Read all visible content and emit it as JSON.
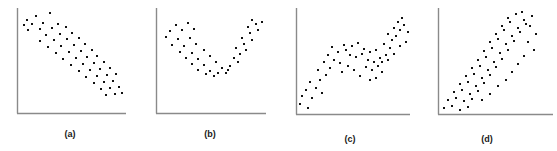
{
  "figure": {
    "width": 557,
    "height": 151,
    "background": "#ffffff",
    "axis_color": "#8a8a8a",
    "dot_color": "#111111",
    "label_color": "#1a1a1a"
  },
  "panels": [
    {
      "id": "panel-a",
      "label": "(a)",
      "left": 0,
      "label_left": 0,
      "label_top": 129,
      "label_width": 140,
      "axis": {
        "x": 17,
        "y_top": 8,
        "y_bottom": 113,
        "x_right": 126
      },
      "pattern": "negative linear association"
    },
    {
      "id": "panel-b",
      "label": "(b)",
      "left": 0,
      "label_left": 140,
      "label_top": 129,
      "label_width": 140,
      "axis": {
        "x": 156,
        "y_top": 8,
        "y_bottom": 113,
        "x_right": 266
      },
      "pattern": "curved U-shaped (quadratic) association"
    },
    {
      "id": "panel-c",
      "label": "(c)",
      "left": 0,
      "label_left": 280,
      "label_top": 134,
      "label_width": 140,
      "axis": {
        "x": 296,
        "y_top": 8,
        "y_bottom": 114,
        "x_right": 410
      },
      "pattern": "increasing with a flat plateau in the middle"
    },
    {
      "id": "panel-d",
      "label": "(d)",
      "left": 0,
      "label_left": 417,
      "label_top": 134,
      "label_width": 140,
      "axis": {
        "x": 438,
        "y_top": 8,
        "y_bottom": 114,
        "x_right": 553
      },
      "pattern": "positive increasing curved association"
    }
  ],
  "chart_data": {
    "type": "scatter",
    "title": "",
    "xlabel": "",
    "ylabel": "",
    "grid": false,
    "legend": "none",
    "axes_shown": [
      "x",
      "y"
    ],
    "tick_labels": [],
    "panels": [
      {
        "name": "(a)",
        "pattern": "negative linear",
        "xlim": [
          17,
          126
        ],
        "ylim": [
          8,
          113
        ],
        "points": [
          [
            27,
            20
          ],
          [
            36,
            16
          ],
          [
            50,
            13
          ],
          [
            24,
            25
          ],
          [
            32,
            24
          ],
          [
            43,
            23
          ],
          [
            58,
            24
          ],
          [
            28,
            30
          ],
          [
            40,
            29
          ],
          [
            52,
            28
          ],
          [
            66,
            27
          ],
          [
            46,
            35
          ],
          [
            60,
            34
          ],
          [
            72,
            33
          ],
          [
            40,
            41
          ],
          [
            54,
            40
          ],
          [
            67,
            39
          ],
          [
            79,
            38
          ],
          [
            48,
            47
          ],
          [
            61,
            46
          ],
          [
            74,
            45
          ],
          [
            85,
            44
          ],
          [
            56,
            53
          ],
          [
            69,
            52
          ],
          [
            81,
            51
          ],
          [
            92,
            50
          ],
          [
            63,
            59
          ],
          [
            76,
            58
          ],
          [
            87,
            57
          ],
          [
            97,
            56
          ],
          [
            71,
            65
          ],
          [
            83,
            64
          ],
          [
            94,
            63
          ],
          [
            104,
            62
          ],
          [
            79,
            71
          ],
          [
            90,
            70
          ],
          [
            100,
            69
          ],
          [
            110,
            68
          ],
          [
            86,
            77
          ],
          [
            97,
            76
          ],
          [
            107,
            75
          ],
          [
            116,
            74
          ],
          [
            94,
            83
          ],
          [
            104,
            82
          ],
          [
            113,
            81
          ],
          [
            101,
            89
          ],
          [
            110,
            88
          ],
          [
            119,
            87
          ],
          [
            106,
            95
          ],
          [
            115,
            94
          ],
          [
            122,
            93
          ]
        ]
      },
      {
        "name": "(b)",
        "pattern": "U-shaped curve",
        "xlim": [
          156,
          266
        ],
        "ylim": [
          8,
          113
        ],
        "points": [
          [
            176,
            25
          ],
          [
            188,
            23
          ],
          [
            170,
            31
          ],
          [
            182,
            30
          ],
          [
            194,
            29
          ],
          [
            166,
            37
          ],
          [
            178,
            39
          ],
          [
            190,
            38
          ],
          [
            172,
            45
          ],
          [
            184,
            46
          ],
          [
            196,
            44
          ],
          [
            180,
            52
          ],
          [
            192,
            53
          ],
          [
            204,
            50
          ],
          [
            186,
            58
          ],
          [
            198,
            59
          ],
          [
            210,
            56
          ],
          [
            192,
            64
          ],
          [
            204,
            65
          ],
          [
            216,
            62
          ],
          [
            198,
            70
          ],
          [
            210,
            71
          ],
          [
            222,
            68
          ],
          [
            206,
            74
          ],
          [
            218,
            73
          ],
          [
            228,
            70
          ],
          [
            214,
            76
          ],
          [
            226,
            73
          ],
          [
            230,
            66
          ],
          [
            238,
            62
          ],
          [
            234,
            58
          ],
          [
            240,
            54
          ],
          [
            246,
            50
          ],
          [
            236,
            48
          ],
          [
            244,
            44
          ],
          [
            252,
            40
          ],
          [
            242,
            38
          ],
          [
            250,
            33
          ],
          [
            258,
            30
          ],
          [
            248,
            27
          ],
          [
            256,
            24
          ],
          [
            262,
            22
          ],
          [
            252,
            20
          ]
        ]
      },
      {
        "name": "(c)",
        "pattern": "rising then plateau then rising",
        "xlim": [
          296,
          410
        ],
        "ylim": [
          8,
          114
        ],
        "points": [
          [
            300,
            104
          ],
          [
            308,
            108
          ],
          [
            302,
            96
          ],
          [
            312,
            98
          ],
          [
            306,
            90
          ],
          [
            316,
            88
          ],
          [
            322,
            93
          ],
          [
            310,
            82
          ],
          [
            320,
            80
          ],
          [
            326,
            75
          ],
          [
            318,
            70
          ],
          [
            330,
            68
          ],
          [
            324,
            62
          ],
          [
            334,
            60
          ],
          [
            340,
            63
          ],
          [
            328,
            55
          ],
          [
            338,
            52
          ],
          [
            346,
            50
          ],
          [
            332,
            47
          ],
          [
            344,
            45
          ],
          [
            352,
            46
          ],
          [
            358,
            43
          ],
          [
            350,
            55
          ],
          [
            356,
            57
          ],
          [
            362,
            54
          ],
          [
            364,
            49
          ],
          [
            370,
            52
          ],
          [
            376,
            50
          ],
          [
            368,
            60
          ],
          [
            374,
            62
          ],
          [
            380,
            58
          ],
          [
            366,
            67
          ],
          [
            372,
            70
          ],
          [
            378,
            66
          ],
          [
            382,
            62
          ],
          [
            386,
            55
          ],
          [
            390,
            48
          ],
          [
            384,
            44
          ],
          [
            392,
            40
          ],
          [
            388,
            34
          ],
          [
            396,
            36
          ],
          [
            394,
            28
          ],
          [
            400,
            30
          ],
          [
            398,
            22
          ],
          [
            404,
            25
          ],
          [
            402,
            18
          ],
          [
            408,
            32
          ],
          [
            406,
            42
          ],
          [
            400,
            46
          ],
          [
            394,
            54
          ],
          [
            388,
            60
          ],
          [
            382,
            72
          ],
          [
            376,
            78
          ],
          [
            370,
            80
          ],
          [
            360,
            76
          ],
          [
            354,
            70
          ],
          [
            348,
            66
          ],
          [
            342,
            72
          ]
        ]
      },
      {
        "name": "(d)",
        "pattern": "increasing curved",
        "xlim": [
          438,
          553
        ],
        "ylim": [
          8,
          114
        ],
        "points": [
          [
            444,
            108
          ],
          [
            452,
            106
          ],
          [
            460,
            110
          ],
          [
            468,
            107
          ],
          [
            448,
            100
          ],
          [
            456,
            98
          ],
          [
            464,
            101
          ],
          [
            472,
            99
          ],
          [
            454,
            92
          ],
          [
            462,
            90
          ],
          [
            470,
            94
          ],
          [
            478,
            91
          ],
          [
            460,
            84
          ],
          [
            468,
            82
          ],
          [
            476,
            86
          ],
          [
            484,
            83
          ],
          [
            466,
            76
          ],
          [
            474,
            74
          ],
          [
            482,
            78
          ],
          [
            490,
            75
          ],
          [
            472,
            68
          ],
          [
            480,
            66
          ],
          [
            488,
            70
          ],
          [
            496,
            67
          ],
          [
            478,
            60
          ],
          [
            486,
            57
          ],
          [
            494,
            62
          ],
          [
            502,
            59
          ],
          [
            484,
            51
          ],
          [
            492,
            48
          ],
          [
            500,
            53
          ],
          [
            508,
            50
          ],
          [
            490,
            42
          ],
          [
            498,
            39
          ],
          [
            506,
            44
          ],
          [
            514,
            41
          ],
          [
            496,
            34
          ],
          [
            504,
            30
          ],
          [
            512,
            36
          ],
          [
            520,
            32
          ],
          [
            502,
            26
          ],
          [
            510,
            22
          ],
          [
            518,
            28
          ],
          [
            526,
            24
          ],
          [
            508,
            18
          ],
          [
            516,
            14
          ],
          [
            524,
            20
          ],
          [
            532,
            16
          ],
          [
            522,
            12
          ],
          [
            530,
            26
          ],
          [
            536,
            34
          ],
          [
            528,
            42
          ],
          [
            534,
            50
          ],
          [
            524,
            56
          ],
          [
            518,
            64
          ],
          [
            512,
            72
          ],
          [
            506,
            80
          ],
          [
            498,
            86
          ],
          [
            490,
            94
          ],
          [
            482,
            100
          ]
        ]
      }
    ]
  }
}
